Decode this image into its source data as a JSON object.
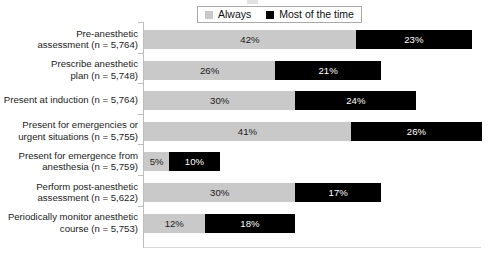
{
  "legend": {
    "entries": [
      {
        "label": "Always",
        "color": "#c9c9c9",
        "icon": "square-swatch-icon"
      },
      {
        "label": "Most of the time",
        "color": "#000000",
        "icon": "square-swatch-icon"
      }
    ]
  },
  "chart_data": {
    "type": "bar",
    "orientation": "horizontal",
    "stacked": true,
    "title": "",
    "xlabel": "",
    "ylabel": "",
    "xlim": [
      0,
      67
    ],
    "grid": false,
    "legend_position": "top-center",
    "value_suffix": "%",
    "categories": [
      "Pre-anesthetic assessment (n = 5,764)",
      "Prescribe anesthetic plan (n = 5,748)",
      "Present at induction (n = 5,764)",
      "Present for emergencies or urgent situations (n = 5,755)",
      "Present for emergence from anesthesia (n = 5,759)",
      "Perform post-anesthetic assessment (n = 5,622)",
      "Periodically monitor anesthetic course (n = 5,753)"
    ],
    "category_lines": [
      [
        "Pre-anesthetic",
        "assessment (n = 5,764)"
      ],
      [
        "Prescribe anesthetic",
        "plan (n = 5,748)"
      ],
      [
        "Present at induction (n = 5,764)"
      ],
      [
        "Present for emergencies or",
        "urgent situations (n = 5,755)"
      ],
      [
        "Present for emergence from",
        "anesthesia (n = 5,759)"
      ],
      [
        "Perform post-anesthetic",
        "assessment (n = 5,622)"
      ],
      [
        "Periodically monitor anesthetic",
        "course (n = 5,753)"
      ]
    ],
    "series": [
      {
        "name": "Always",
        "color": "#c9c9c9",
        "values": [
          42,
          26,
          30,
          41,
          5,
          30,
          12
        ],
        "labels": [
          "42%",
          "26%",
          "30%",
          "41%",
          "5%",
          "30%",
          "12%"
        ]
      },
      {
        "name": "Most of the time",
        "color": "#000000",
        "values": [
          23,
          21,
          24,
          26,
          10,
          17,
          18
        ],
        "labels": [
          "23%",
          "21%",
          "24%",
          "26%",
          "10%",
          "17%",
          "18%"
        ]
      }
    ],
    "totals": [
      65,
      47,
      54,
      67,
      15,
      47,
      30
    ]
  }
}
